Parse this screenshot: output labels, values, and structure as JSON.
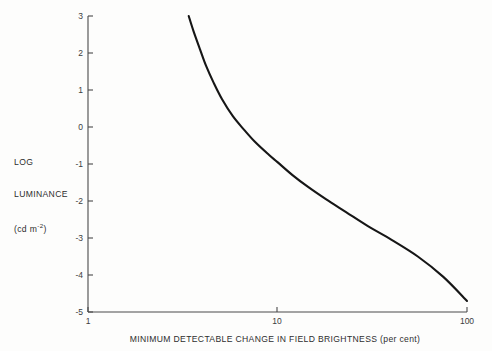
{
  "figure": {
    "background_color": "#fdfdfc",
    "curve_color": "#161616",
    "axis_color": "#4a4a4a"
  },
  "axis_titles": {
    "y_line1": "LOG",
    "y_line2": "LUMINANCE",
    "y_units_prefix": "(cd m",
    "y_units_exponent": "-2",
    "y_units_suffix": ")",
    "x": "MINIMUM DETECTABLE CHANGE IN FIELD BRIGHTNESS (per cent)"
  },
  "chart_data": {
    "type": "line",
    "title": "",
    "subtitle": "",
    "xlabel": "MINIMUM DETECTABLE CHANGE IN FIELD BRIGHTNESS (per cent)",
    "ylabel": "LOG LUMINANCE (cd m-2)",
    "xscale": "log",
    "yscale": "linear",
    "xlim": [
      1,
      100
    ],
    "ylim": [
      -5,
      3
    ],
    "grid": false,
    "legend": null,
    "xticks": [
      1,
      10,
      100
    ],
    "xtick_labels": [
      "1",
      "10",
      "100"
    ],
    "yticks": [
      3,
      2,
      1,
      0,
      -1,
      -2,
      -3,
      -4,
      -5
    ],
    "ytick_labels": [
      "3",
      "2",
      "1",
      "0",
      "-1",
      "-2",
      "-3",
      "-4",
      "-5"
    ],
    "series": [
      {
        "name": "minimum detectable contrast threshold",
        "x": [
          3.4,
          3.6,
          3.9,
          4.2,
          4.6,
          5.1,
          5.8,
          6.6,
          7.6,
          9.0,
          10.0,
          12.0,
          14.5,
          18.0,
          23.0,
          30.0,
          40.0,
          55.0,
          75.0,
          100.0
        ],
        "y": [
          3.0,
          2.6,
          2.1,
          1.65,
          1.2,
          0.75,
          0.3,
          -0.05,
          -0.4,
          -0.75,
          -0.95,
          -1.3,
          -1.62,
          -1.95,
          -2.3,
          -2.68,
          -3.05,
          -3.5,
          -4.05,
          -4.7
        ]
      }
    ],
    "annotations": []
  },
  "tick_positions": {
    "x_px": {
      "1": 88,
      "10": 277,
      "100": 467
    },
    "y_px": {
      "3": 16,
      "-5": 312
    }
  }
}
